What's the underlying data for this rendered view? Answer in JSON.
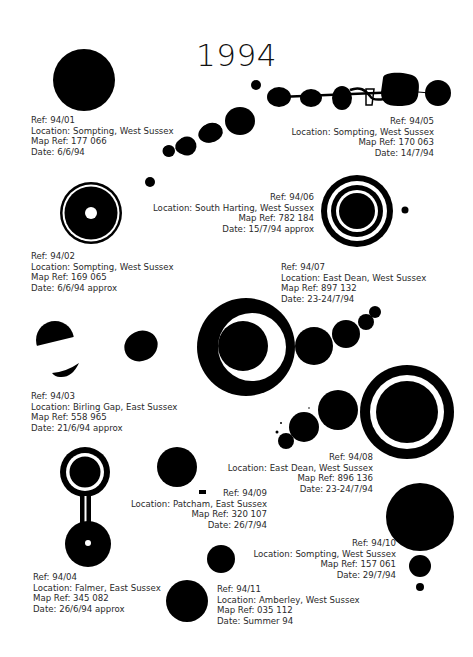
{
  "title": "1994",
  "ink_color": "#000000",
  "paper_color": "#ffffff",
  "entries": [
    {
      "ref": "Ref: 94/01",
      "location": "Location: Sompting, West Sussex",
      "map_ref": "Map Ref: 177 066",
      "date": "Date: 6/6/94"
    },
    {
      "ref": "Ref: 94/02",
      "location": "Location: Sompting, West Sussex",
      "map_ref": "Map Ref: 169 065",
      "date": "Date: 6/6/94 approx"
    },
    {
      "ref": "Ref: 94/03",
      "location": "Location: Birling Gap, East Sussex",
      "map_ref": "Map Ref: 558 965",
      "date": "Date: 21/6/94 approx"
    },
    {
      "ref": "Ref: 94/04",
      "location": "Location: Falmer, East Sussex",
      "map_ref": "Map Ref: 345 082",
      "date": "Date: 26/6/94 approx"
    },
    {
      "ref": "Ref: 94/05",
      "location": "Location: Sompting, West Sussex",
      "map_ref": "Map Ref: 170 063",
      "date": "Date: 14/7/94"
    },
    {
      "ref": "Ref: 94/06",
      "location": "Location: South Harting, West Sussex",
      "map_ref": "Map Ref: 782 184",
      "date": "Date: 15/7/94 approx"
    },
    {
      "ref": "Ref: 94/07",
      "location": "Location: East Dean, West Sussex",
      "map_ref": "Map Ref: 897 132",
      "date": "Date: 23-24/7/94"
    },
    {
      "ref": "Ref: 94/08",
      "location": "Location: East Dean, West Sussex",
      "map_ref": "Map Ref: 896 136",
      "date": "Date: 23-24/7/94"
    },
    {
      "ref": "Ref: 94/09",
      "location": "Location: Patcham, East Sussex",
      "map_ref": "Map Ref: 320 107",
      "date": "Date: 26/7/94"
    },
    {
      "ref": "Ref: 94/10",
      "location": "Location: Sompting, West Sussex",
      "map_ref": "Map Ref: 157 061",
      "date": "Date: 29/7/94"
    },
    {
      "ref": "Ref: 94/11",
      "location": "Location: Amberley, West Sussex",
      "map_ref": "Map Ref: 035 112",
      "date": "Date: Summer 94"
    }
  ]
}
